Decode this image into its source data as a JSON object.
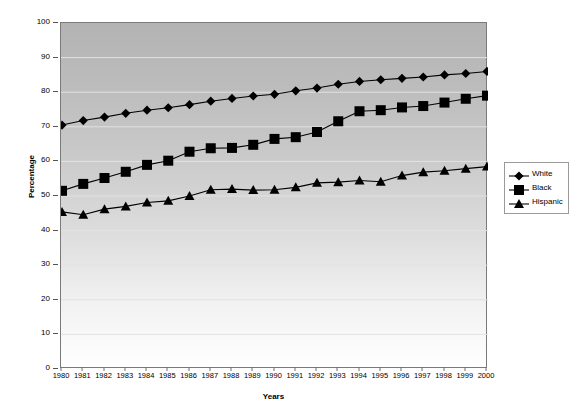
{
  "chart_data": {
    "type": "line",
    "title": "",
    "xlabel": "Years",
    "ylabel": "Percentage",
    "ylim": [
      0,
      100
    ],
    "yticks": [
      0,
      10,
      20,
      30,
      40,
      50,
      60,
      70,
      80,
      90,
      100
    ],
    "grid": true,
    "legend_position": "right",
    "categories": [
      "1980",
      "1981",
      "1982",
      "1983",
      "1984",
      "1985",
      "1986",
      "1987",
      "1988",
      "1989",
      "1990",
      "1991",
      "1992",
      "1993",
      "1994",
      "1995",
      "1996",
      "1997",
      "1998",
      "1999",
      "2000"
    ],
    "series": [
      {
        "name": "White",
        "marker": "diamond",
        "color": "#000000",
        "values": [
          70.5,
          71.8,
          72.8,
          73.9,
          74.8,
          75.5,
          76.4,
          77.4,
          78.2,
          78.9,
          79.4,
          80.4,
          81.2,
          82.3,
          83.1,
          83.6,
          84.0,
          84.4,
          85.0,
          85.4,
          86.0
        ]
      },
      {
        "name": "Black",
        "marker": "square",
        "color": "#000000",
        "values": [
          51.5,
          53.5,
          55.2,
          57.0,
          59.0,
          60.2,
          62.8,
          63.8,
          63.9,
          64.8,
          66.5,
          67.0,
          68.5,
          71.6,
          74.5,
          74.8,
          75.6,
          76.0,
          77.0,
          78.1,
          79.0
        ]
      },
      {
        "name": "Hispanic",
        "marker": "triangle",
        "color": "#000000",
        "values": [
          45.4,
          44.6,
          46.2,
          47.0,
          48.1,
          48.6,
          50.0,
          51.8,
          52.0,
          51.7,
          51.8,
          52.5,
          53.8,
          54.0,
          54.5,
          54.1,
          55.9,
          56.9,
          57.3,
          57.9,
          58.5
        ]
      }
    ]
  },
  "legend": {
    "items": [
      {
        "label": "White"
      },
      {
        "label": "Black"
      },
      {
        "label": "Hispanic"
      }
    ]
  }
}
